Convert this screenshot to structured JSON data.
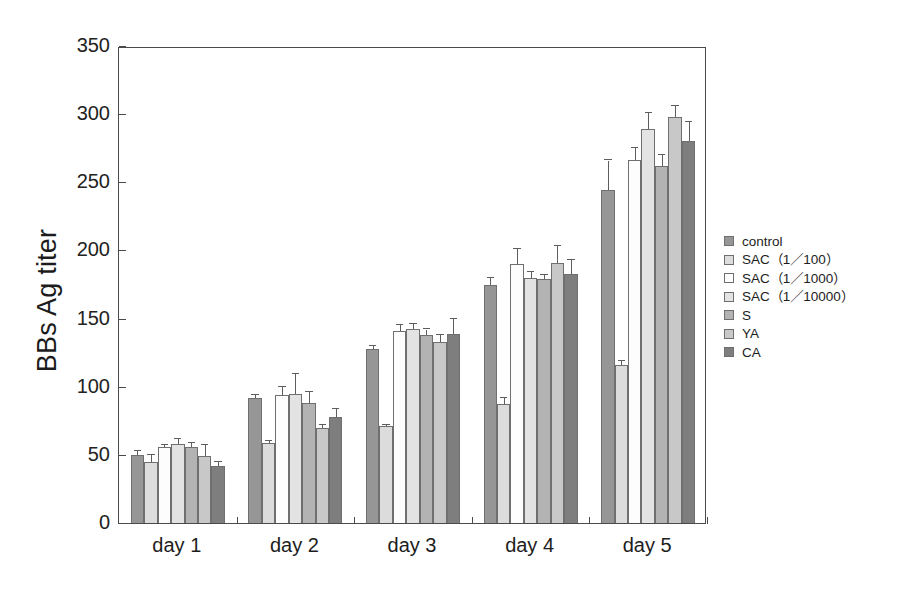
{
  "chart_data": {
    "type": "bar",
    "title": "",
    "xlabel": "",
    "ylabel": "BBs Ag titer",
    "ylim": [
      0,
      350
    ],
    "ytick_values": [
      0,
      50,
      100,
      150,
      200,
      250,
      300,
      350
    ],
    "ytick_labels": [
      "0",
      "50",
      "100",
      "150",
      "200",
      "250",
      "300",
      "350"
    ],
    "grid": false,
    "legend_position": "right",
    "categories": [
      "day 1",
      "day 2",
      "day 3",
      "day 4",
      "day 5"
    ],
    "series": [
      {
        "name": "control",
        "color": "#969696",
        "values": [
          50,
          92,
          128,
          175,
          244
        ],
        "errors": [
          3,
          2,
          2,
          5,
          22
        ]
      },
      {
        "name": "SAC (1/100)",
        "color": "#dcdcdc",
        "values": [
          45,
          59,
          71,
          87,
          116
        ],
        "errors": [
          5,
          1,
          1,
          5,
          3
        ]
      },
      {
        "name": "SAC (1/1000)",
        "color": "#fdfdfd",
        "values": [
          56,
          94,
          141,
          190,
          266
        ],
        "errors": [
          1,
          6,
          4,
          11,
          9
        ]
      },
      {
        "name": "SAC (1/10000)",
        "color": "#e3e3e3",
        "values": [
          58,
          95,
          142,
          180,
          289
        ],
        "errors": [
          4,
          14,
          4,
          4,
          12
        ]
      },
      {
        "name": "S",
        "color": "#b3b3b3",
        "values": [
          56,
          88,
          138,
          179,
          262
        ],
        "errors": [
          3,
          8,
          4,
          3,
          8
        ]
      },
      {
        "name": "YA",
        "color": "#c8c8c8",
        "values": [
          49,
          70,
          133,
          191,
          298
        ],
        "errors": [
          8,
          2,
          5,
          12,
          8
        ]
      },
      {
        "name": "CA",
        "color": "#7e7e7e",
        "values": [
          42,
          78,
          139,
          183,
          280
        ],
        "errors": [
          3,
          6,
          11,
          10,
          14
        ]
      }
    ]
  },
  "legend": {
    "items": [
      {
        "label": "control",
        "color": "#969696"
      },
      {
        "label": "SAC（1／100）",
        "color": "#dcdcdc"
      },
      {
        "label": "SAC（1／1000）",
        "color": "#fdfdfd"
      },
      {
        "label": "SAC（1／10000）",
        "color": "#e3e3e3"
      },
      {
        "label": "S",
        "color": "#b3b3b3"
      },
      {
        "label": "YA",
        "color": "#c8c8c8"
      },
      {
        "label": "CA",
        "color": "#7e7e7e"
      }
    ]
  }
}
